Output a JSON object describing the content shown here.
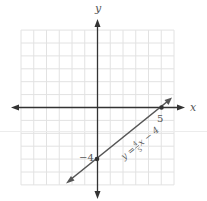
{
  "chart_data": {
    "type": "line",
    "title": "",
    "xlabel": "x",
    "ylabel": "y",
    "xlim": [
      -6,
      6
    ],
    "ylim": [
      -6,
      6
    ],
    "grid": true,
    "series": [
      {
        "name": "y = 4/5 x − 4",
        "equation": "y = (4/5)x - 4",
        "slope": 0.8,
        "intercept": -4,
        "x": [
          -2.5,
          6.5
        ],
        "y": [
          -6,
          1.2
        ],
        "color": "#555555"
      }
    ],
    "points": [
      {
        "x": 5,
        "y": 0,
        "label": "5"
      },
      {
        "x": 0,
        "y": -4,
        "label": "−4"
      }
    ],
    "annotations": [
      {
        "text": "y = 4/5 x − 4",
        "rotated": true,
        "position": "along line"
      }
    ]
  },
  "labels": {
    "x_axis": "x",
    "y_axis": "y",
    "x_intercept": "5",
    "y_intercept": "−4",
    "eq_y": "y =",
    "eq_num": "4",
    "eq_den": "5",
    "eq_rest": "x − 4"
  },
  "colors": {
    "grid": "#e2e2e2",
    "axis": "#333333",
    "line": "#555555",
    "text": "#555555"
  }
}
